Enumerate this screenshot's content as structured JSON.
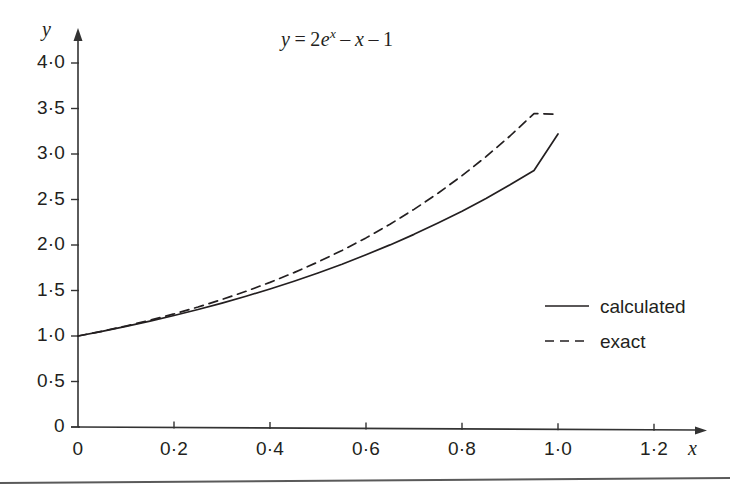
{
  "chart_data": {
    "type": "line",
    "title_parts": {
      "lhs": "y",
      "eq": "=",
      "coeff": "2",
      "base": "e",
      "exp": "x",
      "minus1": "–",
      "term_x": "x",
      "minus2": "–",
      "const": "1"
    },
    "xlabel": "x",
    "ylabel": "y",
    "xlim": [
      0,
      1.3
    ],
    "ylim": [
      0,
      4.25
    ],
    "xticks": [
      0,
      0.2,
      0.4,
      0.6,
      0.8,
      1.0,
      1.2
    ],
    "xtick_labels": [
      "0",
      "0·2",
      "0·4",
      "0·6",
      "0·8",
      "1·0",
      "1·2"
    ],
    "yticks": [
      0,
      0.5,
      1.0,
      1.5,
      2.0,
      2.5,
      3.0,
      3.5,
      4.0
    ],
    "ytick_labels": [
      "0",
      "0·5",
      "1·0",
      "1·5",
      "2·0",
      "2·5",
      "3·0",
      "3·5",
      "4·0"
    ],
    "grid": false,
    "legend_position": "right-middle",
    "axis_color": "#333333",
    "curve_color": "#231f20",
    "series": [
      {
        "name": "calculated",
        "style": "solid",
        "x": [
          0.0,
          0.05,
          0.1,
          0.15,
          0.2,
          0.25,
          0.3,
          0.35,
          0.4,
          0.45,
          0.5,
          0.55,
          0.6,
          0.65,
          0.7,
          0.75,
          0.8,
          0.85,
          0.9,
          0.95,
          1.0
        ],
        "values": [
          1.0,
          1.051,
          1.105,
          1.163,
          1.225,
          1.291,
          1.362,
          1.437,
          1.517,
          1.602,
          1.693,
          1.789,
          1.892,
          2.001,
          2.117,
          2.241,
          2.372,
          2.512,
          2.661,
          2.819,
          3.22
        ]
      },
      {
        "name": "exact",
        "style": "dashed",
        "x": [
          0.0,
          0.05,
          0.1,
          0.15,
          0.2,
          0.25,
          0.3,
          0.35,
          0.4,
          0.45,
          0.5,
          0.55,
          0.6,
          0.65,
          0.7,
          0.75,
          0.8,
          0.85,
          0.9,
          0.95,
          1.0
        ],
        "values": [
          1.0,
          1.0526,
          1.1103,
          1.1736,
          1.2428,
          1.3185,
          1.4011,
          1.4913,
          1.5896,
          1.6967,
          1.8133,
          1.9402,
          2.0782,
          2.2283,
          2.3915,
          2.5688,
          2.7614,
          2.9706,
          3.1978,
          3.4444,
          3.4366
        ]
      }
    ],
    "legend": [
      {
        "label": "calculated",
        "style": "solid"
      },
      {
        "label": "exact",
        "style": "dashed"
      }
    ]
  }
}
